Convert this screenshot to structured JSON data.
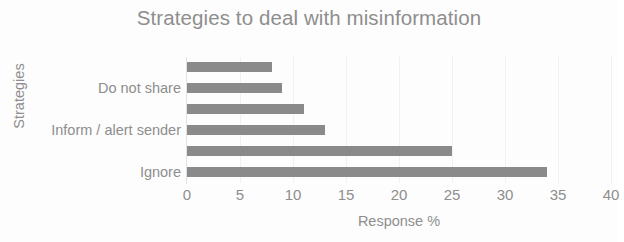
{
  "chart_data": {
    "type": "bar",
    "orientation": "horizontal",
    "title": "Strategies to deal with misinformation",
    "xlabel": "Response %",
    "ylabel": "Strategies",
    "categories": [
      "Ignore",
      "",
      "Inform / alert sender",
      "",
      "Do not share",
      ""
    ],
    "values": [
      34,
      25,
      13,
      11,
      9,
      8
    ],
    "xlim": [
      0,
      40
    ],
    "xticks": [
      0,
      5,
      10,
      15,
      20,
      25,
      30,
      35,
      40
    ],
    "xtick_labels": [
      "0",
      "5",
      "10",
      "15",
      "20",
      "25",
      "30",
      "35",
      "40"
    ],
    "grid": true,
    "grid_axis": "x",
    "legend": false,
    "bar_color": "#8a8a8a",
    "text_color": "#8e8e8e",
    "background": "#fdfdfd",
    "visible_category_labels": [
      {
        "label": "Do not share",
        "bar_index": 4
      },
      {
        "label": "Inform / alert sender",
        "bar_index": 2
      },
      {
        "label": "Ignore",
        "bar_index": 0
      }
    ],
    "bars_top_to_bottom": [
      {
        "label": "",
        "value": 8
      },
      {
        "label": "Do not share",
        "value": 9
      },
      {
        "label": "",
        "value": 11
      },
      {
        "label": "Inform / alert sender",
        "value": 13
      },
      {
        "label": "",
        "value": 25
      },
      {
        "label": "Ignore",
        "value": 34
      }
    ]
  }
}
